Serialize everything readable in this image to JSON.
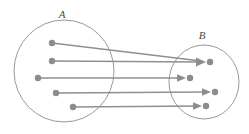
{
  "diagram": {
    "type": "set-mapping",
    "background_color": "#ffffff",
    "stroke_color": "#9a9a9a",
    "dot_color": "#8c8c8c",
    "line_color": "#8f8f8f",
    "label_color": "#4a4a4a",
    "sets": [
      {
        "id": "A",
        "label": "A",
        "label_x": 62,
        "label_y": 18,
        "center_x": 64,
        "center_y": 71,
        "radius_x": 50,
        "radius_y": 51,
        "elements": [
          {
            "id": "a1",
            "x": 52,
            "y": 43
          },
          {
            "id": "a2",
            "x": 52,
            "y": 61
          },
          {
            "id": "a3",
            "x": 38,
            "y": 78
          },
          {
            "id": "a4",
            "x": 56,
            "y": 93
          },
          {
            "id": "a5",
            "x": 73,
            "y": 107
          }
        ]
      },
      {
        "id": "B",
        "label": "B",
        "label_x": 202,
        "label_y": 39,
        "center_x": 204,
        "center_y": 82,
        "radius_x": 35,
        "radius_y": 37,
        "elements": [
          {
            "id": "b1",
            "x": 210,
            "y": 62
          },
          {
            "id": "b2",
            "x": 190,
            "y": 78
          },
          {
            "id": "b3",
            "x": 215,
            "y": 92
          },
          {
            "id": "b4",
            "x": 206,
            "y": 106
          }
        ]
      }
    ],
    "mappings": [
      {
        "id": "m1",
        "from": "a1",
        "to": "b1",
        "x1": 52,
        "y1": 43,
        "x2": 201,
        "y2": 61
      },
      {
        "id": "m2",
        "from": "a2",
        "to": "b1",
        "x1": 52,
        "y1": 61,
        "x2": 201,
        "y2": 62
      },
      {
        "id": "m3",
        "from": "a3",
        "to": "b2",
        "x1": 38,
        "y1": 78,
        "x2": 181,
        "y2": 78
      },
      {
        "id": "m4",
        "from": "a4",
        "to": "b3",
        "x1": 56,
        "y1": 93,
        "x2": 206,
        "y2": 92
      },
      {
        "id": "m5",
        "from": "a5",
        "to": "b4",
        "x1": 73,
        "y1": 107,
        "x2": 197,
        "y2": 106
      }
    ],
    "dot_radius": 3.2,
    "arrow_length": 9,
    "arrow_half_width": 4.2
  }
}
